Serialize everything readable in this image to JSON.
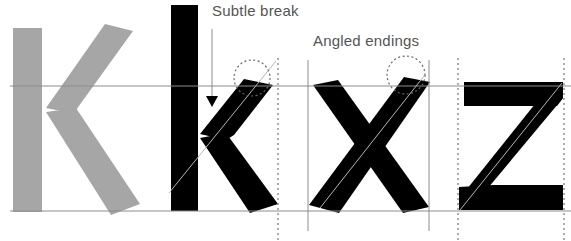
{
  "diagram": {
    "annotations": {
      "subtle_break": "Subtle break",
      "angled_endings": "Angled endings"
    },
    "glyphs": [
      {
        "char": "K",
        "style": "reference",
        "color": "#a6a6a6"
      },
      {
        "char": "k",
        "style": "solid",
        "color": "#000000"
      },
      {
        "char": "x",
        "style": "solid",
        "color": "#000000"
      },
      {
        "char": "z",
        "style": "solid",
        "color": "#000000"
      }
    ],
    "guides": {
      "x_height_line": "x-height",
      "baseline": "baseline",
      "guide_color": "#8c8c8c",
      "dotted_color": "#777777"
    },
    "colors": {
      "background": "#ffffff",
      "ink": "#000000",
      "reference_gray": "#a6a6a6",
      "label_text": "#555555"
    }
  }
}
